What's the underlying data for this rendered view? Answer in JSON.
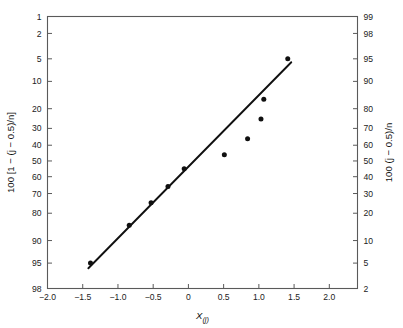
{
  "figure": {
    "background_color": "#ffffff",
    "axis_color": "#5a5a5a",
    "data_color": "#101010"
  },
  "chart_data": {
    "type": "scatter",
    "title": "",
    "subtitle": "",
    "xlabel": "X(j)",
    "xlabel_base": "X",
    "xlabel_subscript": "(j)",
    "ylabel_left": "100 [1 − (j − 0.5)/n]",
    "ylabel_right": "100 (j − 0.5)/n",
    "xlim": [
      -2.0,
      2.4
    ],
    "xticks": [
      -2.0,
      -1.5,
      -1.0,
      -0.5,
      0,
      0.5,
      1.0,
      1.5,
      2.0
    ],
    "xticklabels": [
      "−2.0",
      "−1.5",
      "−1.0",
      "−0.5",
      "0",
      "0.5",
      "1.0",
      "1.5",
      "2.0"
    ],
    "ylim_left": [
      1,
      98
    ],
    "yticks_left": [
      1,
      2,
      5,
      10,
      20,
      30,
      40,
      50,
      60,
      70,
      80,
      90,
      95,
      98
    ],
    "yticklabels_left": [
      "1",
      "2",
      "5",
      "10",
      "20",
      "30",
      "40",
      "50",
      "60",
      "70",
      "80",
      "90",
      "95",
      "98"
    ],
    "yticks_right": [
      99,
      98,
      95,
      90,
      80,
      70,
      60,
      50,
      40,
      30,
      20,
      10,
      5,
      2
    ],
    "yticklabels_right": [
      "99",
      "98",
      "95",
      "90",
      "80",
      "70",
      "60",
      "50",
      "40",
      "30",
      "20",
      "10",
      "5",
      "2"
    ],
    "y_scale": "normal-probability",
    "grid": false,
    "legend": false,
    "points": [
      {
        "x": -1.39,
        "y_left": 95.0,
        "y_right": 5.0
      },
      {
        "x": -0.84,
        "y_left": 85.0,
        "y_right": 15.0
      },
      {
        "x": -0.53,
        "y_left": 75.0,
        "y_right": 25.0
      },
      {
        "x": -0.29,
        "y_left": 66.0,
        "y_right": 34.0
      },
      {
        "x": -0.06,
        "y_left": 55.0,
        "y_right": 45.0
      },
      {
        "x": 0.51,
        "y_left": 46.0,
        "y_right": 54.0
      },
      {
        "x": 0.84,
        "y_left": 36.0,
        "y_right": 64.0
      },
      {
        "x": 1.03,
        "y_left": 25.0,
        "y_right": 75.0
      },
      {
        "x": 1.07,
        "y_left": 16.0,
        "y_right": 84.0
      },
      {
        "x": 1.41,
        "y_left": 5.0,
        "y_right": 95.0
      }
    ],
    "fit_line": {
      "type": "straight-line",
      "x_start": -1.42,
      "y_left_start": 95.8,
      "x_end": 1.46,
      "y_left_end": 5.6
    }
  }
}
